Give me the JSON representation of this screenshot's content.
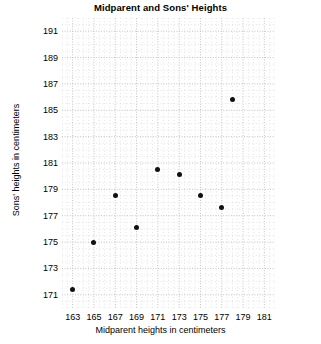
{
  "chart_data": {
    "type": "scatter",
    "title": "Midparent and Sons' Heights",
    "xlabel": "Midparent heights in centimeters",
    "ylabel": "Sons' heights in centimeters",
    "xlim": [
      162,
      182
    ],
    "ylim": [
      170,
      192
    ],
    "xticks": [
      163,
      165,
      167,
      169,
      171,
      173,
      175,
      177,
      179,
      181
    ],
    "yticks": [
      171,
      173,
      175,
      177,
      179,
      181,
      183,
      185,
      187,
      189,
      191
    ],
    "grid": true,
    "grid_style": "dotted",
    "grid_color": "#cccccc",
    "legend": "none",
    "marker_color": "#111111",
    "marker_size": 5,
    "x": [
      163,
      165,
      167,
      169,
      171,
      173,
      175,
      177,
      178
    ],
    "y": [
      171.4,
      175.0,
      178.5,
      176.1,
      180.5,
      180.1,
      178.5,
      177.6,
      185.8
    ],
    "points": [
      {
        "x": 163,
        "y": 171.4
      },
      {
        "x": 165,
        "y": 175.0
      },
      {
        "x": 167,
        "y": 178.5
      },
      {
        "x": 169,
        "y": 176.1
      },
      {
        "x": 171,
        "y": 180.5
      },
      {
        "x": 173,
        "y": 180.1
      },
      {
        "x": 175,
        "y": 178.5
      },
      {
        "x": 177,
        "y": 177.6
      },
      {
        "x": 178,
        "y": 185.8
      }
    ]
  },
  "colors": {
    "background": "#ffffff",
    "text": "#000000",
    "marker": "#111111",
    "grid": "#cccccc"
  }
}
